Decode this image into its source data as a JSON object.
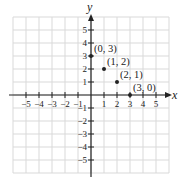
{
  "chart_data": {
    "type": "scatter",
    "title": "",
    "xlabel": "x",
    "ylabel": "y",
    "xlim": [
      -6,
      6
    ],
    "ylim": [
      -6,
      6
    ],
    "grid": true,
    "x_ticks": [
      -5,
      -4,
      -3,
      -2,
      -1,
      1,
      2,
      3,
      4,
      5
    ],
    "y_ticks": [
      5,
      4,
      3,
      2,
      1,
      -1,
      -2,
      -3,
      -4,
      -5
    ],
    "x_tick_labels": [
      "−5",
      "−4",
      "−3",
      "−2",
      "−1",
      "1",
      "2",
      "3",
      "4",
      "5"
    ],
    "y_tick_labels": [
      "5",
      "4",
      "3",
      "2",
      "1",
      "−1",
      "−2",
      "−3",
      "−4",
      "−5"
    ],
    "points": [
      {
        "x": 0,
        "y": 3,
        "label": "(0, 3)"
      },
      {
        "x": 1,
        "y": 2,
        "label": "(1, 2)"
      },
      {
        "x": 2,
        "y": 1,
        "label": "(2, 1)"
      },
      {
        "x": 3,
        "y": 0,
        "label": "(3, 0)"
      }
    ]
  },
  "style": {
    "grid_color": "#d9d9d9",
    "axis_color": "#222222",
    "point_color": "#222222"
  }
}
